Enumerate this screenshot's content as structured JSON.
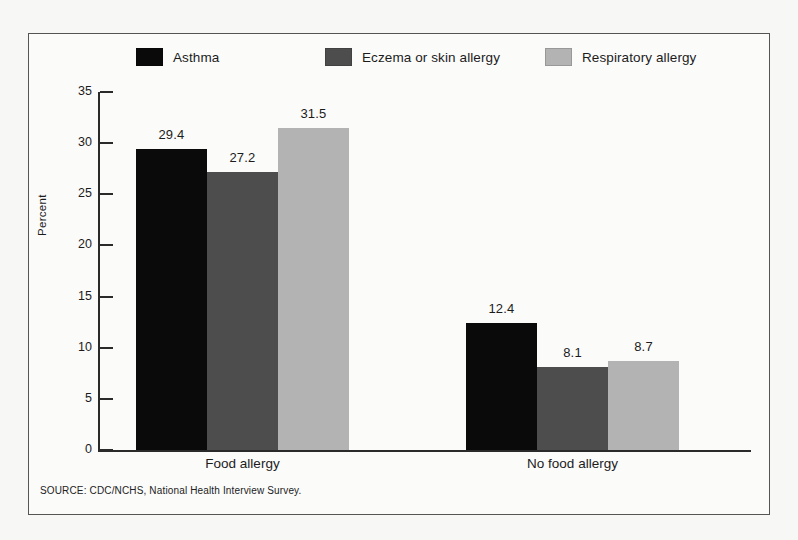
{
  "chart_data": {
    "type": "bar",
    "title": "",
    "xlabel": "",
    "ylabel": "Percent",
    "ylim": [
      0,
      35
    ],
    "yticks": [
      0,
      5,
      10,
      15,
      20,
      25,
      30,
      35
    ],
    "grid": false,
    "legend_position": "top",
    "categories": [
      "Food allergy",
      "No food allergy"
    ],
    "series": [
      {
        "name": "Asthma",
        "color": "#0a0a0a",
        "values": [
          29.4,
          12.4
        ]
      },
      {
        "name": "Eczema or skin allergy",
        "color": "#4d4d4d",
        "values": [
          27.2,
          8.1
        ]
      },
      {
        "name": "Respiratory allergy",
        "color": "#b3b3b3",
        "values": [
          31.5,
          8.7
        ]
      }
    ],
    "value_labels": [
      [
        "29.4",
        "27.2",
        "31.5"
      ],
      [
        "12.4",
        "8.1",
        "8.7"
      ]
    ],
    "ytick_labels": [
      "0",
      "5",
      "10",
      "15",
      "20",
      "25",
      "30",
      "35"
    ],
    "source_note": "SOURCE: CDC/NCHS, National Health Interview Survey."
  },
  "legend": {
    "items": [
      {
        "label": "Asthma",
        "color": "#0a0a0a"
      },
      {
        "label": "Eczema or skin allergy",
        "color": "#4d4d4d"
      },
      {
        "label": "Respiratory allergy",
        "color": "#b3b3b3"
      }
    ]
  },
  "axis": {
    "y_title": "Percent"
  },
  "footer": {
    "source": "SOURCE: CDC/NCHS, National Health Interview Survey."
  }
}
